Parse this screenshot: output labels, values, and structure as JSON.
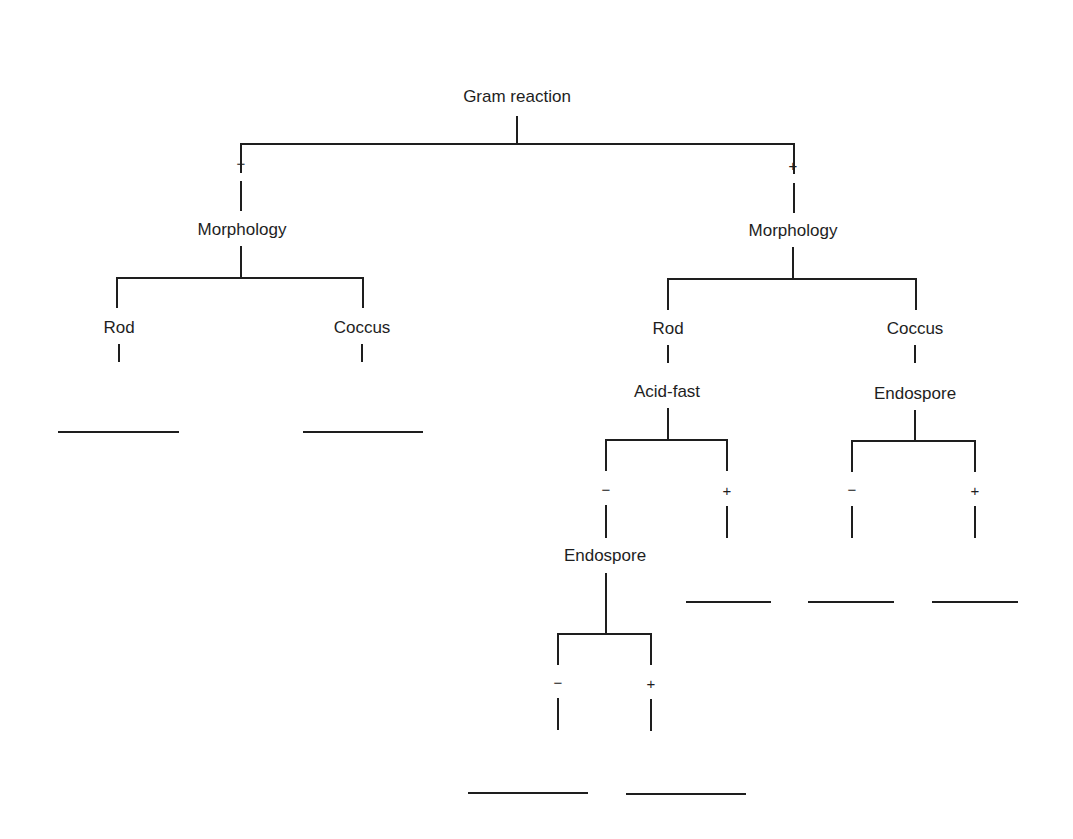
{
  "diagram": {
    "title": "Gram reaction",
    "root": {
      "label": "Gram reaction",
      "branches": {
        "negative": {
          "sign": "−",
          "node": "Morphology",
          "children": {
            "rod": {
              "label": "Rod",
              "answer_blank": ""
            },
            "coccus": {
              "label": "Coccus",
              "answer_blank": ""
            }
          }
        },
        "positive": {
          "sign": "+",
          "node": "Morphology",
          "children": {
            "rod": {
              "label": "Rod",
              "test": "Acid-fast",
              "branches": {
                "negative": {
                  "sign": "−",
                  "test": "Endospore",
                  "branches": {
                    "negative": {
                      "sign": "−",
                      "answer_blank": ""
                    },
                    "positive": {
                      "sign": "+",
                      "answer_blank": ""
                    }
                  }
                },
                "positive": {
                  "sign": "+",
                  "answer_blank": ""
                }
              }
            },
            "coccus": {
              "label": "Coccus",
              "test": "Endospore",
              "branches": {
                "negative": {
                  "sign": "−",
                  "answer_blank": ""
                },
                "positive": {
                  "sign": "+",
                  "answer_blank": ""
                }
              }
            }
          }
        }
      }
    }
  },
  "colors": {
    "line": "#1e1e1e",
    "background": "#ffffff"
  }
}
